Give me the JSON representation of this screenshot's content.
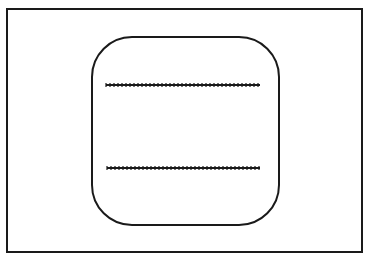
{
  "diagram": {
    "background": "#ffffff",
    "stroke_color": "#1a1a1a",
    "outer_frame": {
      "x": 7,
      "y": 9,
      "width": 355,
      "height": 243,
      "stroke_width": 2
    },
    "rounded_panel": {
      "x": 92,
      "y": 37,
      "width": 187,
      "height": 188,
      "corner_radius": 40,
      "stroke_width": 2
    },
    "lines": [
      {
        "x1": 106,
        "y1": 85,
        "x2": 260,
        "y2": 85,
        "style": "beaded"
      },
      {
        "x1": 107,
        "y1": 168,
        "x2": 260,
        "y2": 168,
        "style": "beaded"
      }
    ]
  }
}
